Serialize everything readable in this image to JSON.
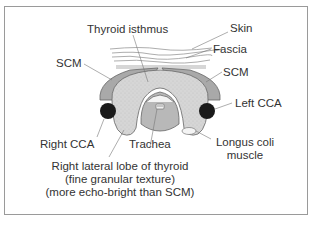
{
  "diagram": {
    "labels": {
      "thyroid_isthmus": "Thyroid isthmus",
      "skin": "Skin",
      "fascia": "Fascia",
      "scm_left_side": "SCM",
      "scm_right_side": "SCM",
      "left_cca": "Left CCA",
      "right_cca": "Right CCA",
      "trachea": "Trachea",
      "longus_coli_line1": "Longus coli",
      "longus_coli_line2": "muscle",
      "right_lobe_line1": "Right lateral lobe of thyroid",
      "right_lobe_line2": "(fine granular texture)",
      "right_lobe_line3": "(more echo-bright than SCM)"
    },
    "colors": {
      "scm": "#a9a9a9",
      "thyroid": "#d4d4d4",
      "trachea": "#b8b8b8",
      "cca": "#1a1a1a",
      "frame": "#9a9a9a",
      "text": "#333333",
      "leader": "#777777"
    }
  }
}
